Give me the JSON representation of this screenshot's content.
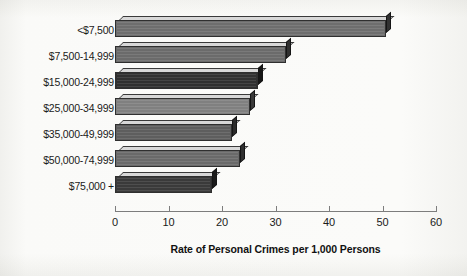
{
  "chart_data": {
    "type": "bar",
    "orientation": "horizontal",
    "title": "",
    "xlabel": "Rate of Personal Crimes per 1,000 Persons",
    "ylabel": "",
    "categories": [
      "<$7,500",
      "$7,500-14,999",
      "$15,000-24,999",
      "$25,000-34,999",
      "$35,000-49,999",
      "$50,000-74,999",
      "$75,000 +"
    ],
    "values": [
      50.6,
      32.0,
      26.8,
      25.2,
      21.9,
      23.4,
      18.2
    ],
    "xlim": [
      0,
      60
    ],
    "xticks": [
      0,
      10,
      20,
      30,
      40,
      50,
      60
    ],
    "xtick_labels": [
      "0",
      "10",
      "20",
      "30",
      "40",
      "50",
      "60"
    ],
    "grid": false,
    "legend": false,
    "bar_colors": [
      "#6e6e6e",
      "#6b6b6b",
      "#303030",
      "#808080",
      "#5e5e5e",
      "#6a6a6a",
      "#3a3a3a"
    ]
  },
  "axis": {
    "title": "Rate of Personal Crimes per 1,000 Persons"
  }
}
